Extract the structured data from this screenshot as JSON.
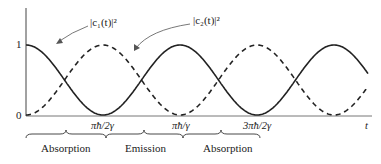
{
  "chart_data": {
    "type": "line",
    "title": "",
    "xlabel": "t",
    "ylabel": "",
    "yticks": [
      "0",
      "1"
    ],
    "xticks": [
      "πħ/2γ",
      "πħ/γ",
      "3πħ/2γ"
    ],
    "ylim": [
      0,
      1
    ],
    "grid": false,
    "series": [
      {
        "name": "|c₁(t)|²",
        "style": "solid",
        "formula": "cos²(γt/ħ)",
        "x": [
          "0",
          "πħ/2γ",
          "πħ/γ",
          "3πħ/2γ"
        ],
        "values": [
          1,
          0,
          1,
          0
        ]
      },
      {
        "name": "|c₂(t)|²",
        "style": "dashed",
        "formula": "sin²(γt/ħ)",
        "x": [
          "0",
          "πħ/2γ",
          "πħ/γ",
          "3πħ/2γ"
        ],
        "values": [
          0,
          1,
          0,
          1
        ]
      }
    ],
    "annotations": [
      {
        "text": "|c₁(t)|²",
        "points_to": "solid curve"
      },
      {
        "text": "|c₂(t)|²",
        "points_to": "dashed curve"
      }
    ],
    "regions": [
      {
        "label": "Absorption",
        "from": "0",
        "to": "πħ/2γ"
      },
      {
        "label": "Emission",
        "from": "πħ/2γ",
        "to": "πħ/γ"
      },
      {
        "label": "Absorption",
        "from": "πħ/γ",
        "to": "3πħ/2γ"
      }
    ]
  },
  "labels": {
    "y1": "1",
    "y0": "0",
    "c1": "|c₁(t)|²",
    "c2": "|c₂(t)|²",
    "tick1": "πħ/2γ",
    "tick2": "πħ/γ",
    "tick3": "3πħ/2γ",
    "t": "t",
    "region1": "Absorption",
    "region2": "Emission",
    "region3": "Absorption"
  }
}
